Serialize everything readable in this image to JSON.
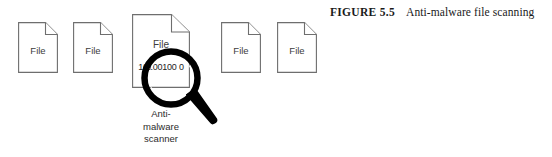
{
  "figure": {
    "caption_label": "FIGURE 5.5",
    "caption_text": "Anti-malware file scanning",
    "files": [
      {
        "label": "File"
      },
      {
        "label": "File"
      },
      {
        "label": "File"
      },
      {
        "label": "File"
      },
      {
        "label": "File"
      }
    ],
    "scanned_file": {
      "label": "File",
      "binary_content": "10100100 0"
    },
    "scanner": {
      "line1": "Anti-",
      "line2": "malware",
      "line3": "scanner"
    },
    "colors": {
      "file_outline": "#6e6e6e",
      "file_label": "#3c3c3c",
      "magnifier": "#000000",
      "caption": "#1a1a1a",
      "background": "#ffffff"
    }
  }
}
